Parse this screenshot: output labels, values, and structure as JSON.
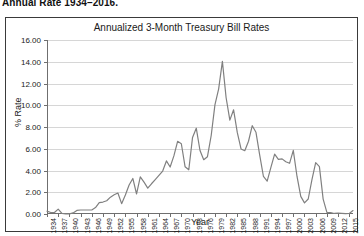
{
  "caption": "Annual Rate 1934–2016.",
  "chart": {
    "title": "Annualized 3-Month Treasury Bill Rates",
    "xlabel": "Year",
    "ylabel": "% Rate"
  },
  "chart_data": {
    "type": "line",
    "title": "Annualized 3-Month Treasury Bill Rates",
    "xlabel": "Year",
    "ylabel": "% Rate",
    "xlim": [
      1934,
      2016
    ],
    "ylim": [
      0.0,
      16.0
    ],
    "ytick_labels": [
      "0.00",
      "2.00",
      "4.00",
      "6.00",
      "8.00",
      "10.00",
      "12.00",
      "14.00",
      "16.00"
    ],
    "ytick_values": [
      0,
      2,
      4,
      6,
      8,
      10,
      12,
      14,
      16
    ],
    "xtick_labels": [
      "1934",
      "1937",
      "1940",
      "1943",
      "1946",
      "1949",
      "1952",
      "1955",
      "1958",
      "1961",
      "1964",
      "1967",
      "1970",
      "1973",
      "1976",
      "1979",
      "1982",
      "1985",
      "1988",
      "1991",
      "1994",
      "1997",
      "2000",
      "2003",
      "2006",
      "2009",
      "2012",
      "2015"
    ],
    "xtick_values": [
      1934,
      1937,
      1940,
      1943,
      1946,
      1949,
      1952,
      1955,
      1958,
      1961,
      1964,
      1967,
      1970,
      1973,
      1976,
      1979,
      1982,
      1985,
      1988,
      1991,
      1994,
      1997,
      2000,
      2003,
      2006,
      2009,
      2012,
      2015
    ],
    "grid": "horizontal",
    "legend": "none",
    "line_color": "#808080",
    "x": [
      1934,
      1935,
      1936,
      1937,
      1938,
      1939,
      1940,
      1941,
      1942,
      1943,
      1944,
      1945,
      1946,
      1947,
      1948,
      1949,
      1950,
      1951,
      1952,
      1953,
      1954,
      1955,
      1956,
      1957,
      1958,
      1959,
      1960,
      1961,
      1962,
      1963,
      1964,
      1965,
      1966,
      1967,
      1968,
      1969,
      1970,
      1971,
      1972,
      1973,
      1974,
      1975,
      1976,
      1977,
      1978,
      1979,
      1980,
      1981,
      1982,
      1983,
      1984,
      1985,
      1986,
      1987,
      1988,
      1989,
      1990,
      1991,
      1992,
      1993,
      1994,
      1995,
      1996,
      1997,
      1998,
      1999,
      2000,
      2001,
      2002,
      2003,
      2004,
      2005,
      2006,
      2007,
      2008,
      2009,
      2010,
      2011,
      2012,
      2013,
      2014,
      2015,
      2016
    ],
    "values": [
      0.26,
      0.14,
      0.14,
      0.45,
      0.05,
      0.02,
      0.01,
      0.1,
      0.33,
      0.37,
      0.37,
      0.37,
      0.37,
      0.59,
      1.04,
      1.1,
      1.22,
      1.55,
      1.77,
      1.93,
      0.95,
      1.75,
      2.66,
      3.27,
      1.84,
      3.41,
      2.93,
      2.38,
      2.78,
      3.16,
      3.55,
      3.95,
      4.88,
      4.32,
      5.34,
      6.68,
      6.46,
      4.35,
      4.07,
      7.04,
      7.89,
      5.84,
      4.99,
      5.27,
      7.22,
      10.04,
      11.51,
      14.03,
      10.69,
      8.63,
      9.58,
      7.48,
      5.98,
      5.82,
      6.69,
      8.12,
      7.51,
      5.42,
      3.45,
      3.02,
      4.29,
      5.51,
      5.02,
      5.07,
      4.81,
      4.66,
      5.85,
      3.45,
      1.62,
      1.02,
      1.38,
      3.16,
      4.73,
      4.36,
      1.37,
      0.15,
      0.14,
      0.05,
      0.09,
      0.06,
      0.03,
      0.05,
      0.32
    ],
    "series": [
      {
        "name": "Annualized 3-Month Treasury Bill Rate",
        "values": [
          0.26,
          0.14,
          0.14,
          0.45,
          0.05,
          0.02,
          0.01,
          0.1,
          0.33,
          0.37,
          0.37,
          0.37,
          0.37,
          0.59,
          1.04,
          1.1,
          1.22,
          1.55,
          1.77,
          1.93,
          0.95,
          1.75,
          2.66,
          3.27,
          1.84,
          3.41,
          2.93,
          2.38,
          2.78,
          3.16,
          3.55,
          3.95,
          4.88,
          4.32,
          5.34,
          6.68,
          6.46,
          4.35,
          4.07,
          7.04,
          7.89,
          5.84,
          4.99,
          5.27,
          7.22,
          10.04,
          11.51,
          14.03,
          10.69,
          8.63,
          9.58,
          7.48,
          5.98,
          5.82,
          6.69,
          8.12,
          7.51,
          5.42,
          3.45,
          3.02,
          4.29,
          5.51,
          5.02,
          5.07,
          4.81,
          4.66,
          5.85,
          3.45,
          1.62,
          1.02,
          1.38,
          3.16,
          4.73,
          4.36,
          1.37,
          0.15,
          0.14,
          0.05,
          0.09,
          0.06,
          0.03,
          0.05,
          0.32
        ]
      }
    ]
  }
}
